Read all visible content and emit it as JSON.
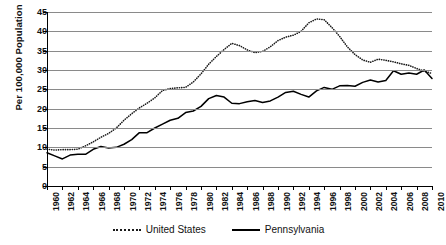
{
  "chart_data": {
    "type": "line",
    "title": "",
    "xlabel": "",
    "ylabel": "Per 100,000 Population",
    "ylim": [
      0,
      45
    ],
    "xlim": [
      1960,
      2010
    ],
    "ytick_step": 5,
    "xtick_step": 2,
    "grid": true,
    "legend_position": "bottom-center",
    "yticks": [
      0,
      5,
      10,
      15,
      20,
      25,
      30,
      35,
      40,
      45
    ],
    "xticks": [
      1960,
      1962,
      1964,
      1966,
      1968,
      1970,
      1972,
      1974,
      1976,
      1978,
      1980,
      1982,
      1984,
      1986,
      1988,
      1990,
      1992,
      1994,
      1996,
      1998,
      2000,
      2002,
      2004,
      2006,
      2008,
      2010
    ],
    "x": [
      1960,
      1961,
      1962,
      1963,
      1964,
      1965,
      1966,
      1967,
      1968,
      1969,
      1970,
      1971,
      1972,
      1973,
      1974,
      1975,
      1976,
      1977,
      1978,
      1979,
      1980,
      1981,
      1982,
      1983,
      1984,
      1985,
      1986,
      1987,
      1988,
      1989,
      1990,
      1991,
      1992,
      1993,
      1994,
      1995,
      1996,
      1997,
      1998,
      1999,
      2000,
      2001,
      2002,
      2003,
      2004,
      2005,
      2006,
      2007,
      2008,
      2009,
      2010
    ],
    "series": [
      {
        "name": "United States",
        "style": "dotted",
        "color": "#1a1a1a",
        "values": [
          9.5,
          9.3,
          9.4,
          9.4,
          9.5,
          10.4,
          11.4,
          12.6,
          13.6,
          15.0,
          17.0,
          18.7,
          20.2,
          21.4,
          22.8,
          24.7,
          25.2,
          25.4,
          25.5,
          26.9,
          29.0,
          31.5,
          33.5,
          35.3,
          36.9,
          36.3,
          35.2,
          34.5,
          34.8,
          36.0,
          37.6,
          38.5,
          39.0,
          40.0,
          42.2,
          43.2,
          43.0,
          41.0,
          38.7,
          36.0,
          34.0,
          32.6,
          32.0,
          32.8,
          32.5,
          32.1,
          31.6,
          31.2,
          30.4,
          29.7,
          29.1
        ]
      },
      {
        "name": "Pennsylvania",
        "style": "solid",
        "color": "#000000",
        "values": [
          8.6,
          7.8,
          7.0,
          8.0,
          8.2,
          8.2,
          9.5,
          10.2,
          9.8,
          10.0,
          10.8,
          12.0,
          13.8,
          13.8,
          15.0,
          16.0,
          17.0,
          17.5,
          19.0,
          19.4,
          20.6,
          22.6,
          23.4,
          23.0,
          21.4,
          21.3,
          21.8,
          22.1,
          21.6,
          22.0,
          23.0,
          24.2,
          24.5,
          23.7,
          23.0,
          24.6,
          25.5,
          25.0,
          25.9,
          26.0,
          25.8,
          26.8,
          27.4,
          26.9,
          27.3,
          29.8,
          28.9,
          29.2,
          28.9,
          30.0,
          27.8
        ]
      }
    ]
  },
  "legend": {
    "items": [
      {
        "label": "United States",
        "marker": "dotted-line-swatch"
      },
      {
        "label": "Pennsylvania",
        "marker": "solid-line-swatch"
      }
    ]
  },
  "axis": {
    "y_title": "Per 100,000 Population"
  }
}
